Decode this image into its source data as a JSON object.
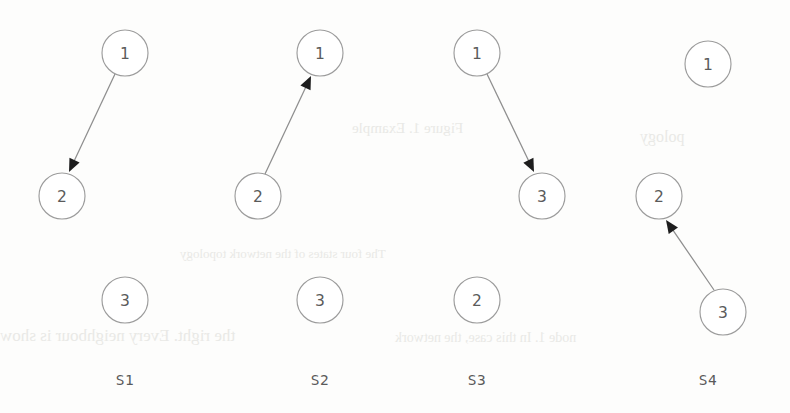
{
  "figure": {
    "title": "",
    "background_color": "#fdfdfc",
    "width": 790,
    "height": 413,
    "node_radius": 23,
    "node_stroke_color": "#9c9c9c",
    "node_fill_color": "#ffffff",
    "node_text_color": "#5b5b5b",
    "edge_color": "#8e8e8e",
    "arrowhead_color": "#1d1d1d",
    "label_color": "#5a5a5a"
  },
  "panels": [
    {
      "id": "s1",
      "label": "S1",
      "label_x": 125,
      "label_y": 372,
      "nodes": [
        {
          "id": "s1-n1",
          "value": "1",
          "cx": 125,
          "cy": 53
        },
        {
          "id": "s1-n2",
          "value": "2",
          "cx": 62,
          "cy": 196
        },
        {
          "id": "s1-n3",
          "value": "3",
          "cx": 125,
          "cy": 300
        }
      ],
      "edges": [
        {
          "id": "s1-e1",
          "from": "1",
          "to": "2",
          "x1": 115,
          "y1": 74,
          "x2": 69,
          "y2": 172
        }
      ]
    },
    {
      "id": "s2",
      "label": "S2",
      "label_x": 320,
      "label_y": 372,
      "nodes": [
        {
          "id": "s2-n1",
          "value": "1",
          "cx": 320,
          "cy": 53
        },
        {
          "id": "s2-n2",
          "value": "2",
          "cx": 258,
          "cy": 196
        },
        {
          "id": "s2-n3",
          "value": "3",
          "cx": 320,
          "cy": 300
        }
      ],
      "edges": [
        {
          "id": "s2-e1",
          "from": "2",
          "to": "1",
          "x1": 265,
          "y1": 174,
          "x2": 311,
          "y2": 76
        }
      ]
    },
    {
      "id": "s3",
      "label": "S3",
      "label_x": 477,
      "label_y": 372,
      "nodes": [
        {
          "id": "s3-n1",
          "value": "1",
          "cx": 477,
          "cy": 53
        },
        {
          "id": "s3-n3",
          "value": "3",
          "cx": 542,
          "cy": 196
        },
        {
          "id": "s3-n2",
          "value": "2",
          "cx": 477,
          "cy": 300
        }
      ],
      "edges": [
        {
          "id": "s3-e1",
          "from": "1",
          "to": "3",
          "x1": 487,
          "y1": 74,
          "x2": 534,
          "y2": 172
        }
      ]
    },
    {
      "id": "s4",
      "label": "S4",
      "label_x": 708,
      "label_y": 372,
      "nodes": [
        {
          "id": "s4-n1",
          "value": "1",
          "cx": 708,
          "cy": 64
        },
        {
          "id": "s4-n2",
          "value": "2",
          "cx": 659,
          "cy": 196
        },
        {
          "id": "s4-n3",
          "value": "3",
          "cx": 723,
          "cy": 312
        }
      ],
      "edges": [
        {
          "id": "s4-e1",
          "from": "3",
          "to": "2",
          "x1": 714,
          "y1": 290,
          "x2": 666,
          "y2": 220
        }
      ]
    }
  ],
  "bleed_artifacts": [
    {
      "text": "Figure 1. Example",
      "x": 352,
      "y": 120,
      "size": 15
    },
    {
      "text": "pology",
      "x": 640,
      "y": 128,
      "size": 16
    },
    {
      "text": "The four states of the network topology",
      "x": 180,
      "y": 246,
      "size": 13
    },
    {
      "text": "the right. Every neighbour is show",
      "x": 0,
      "y": 326,
      "size": 17
    },
    {
      "text": "node 1. In this case, the network",
      "x": 395,
      "y": 330,
      "size": 14
    }
  ]
}
